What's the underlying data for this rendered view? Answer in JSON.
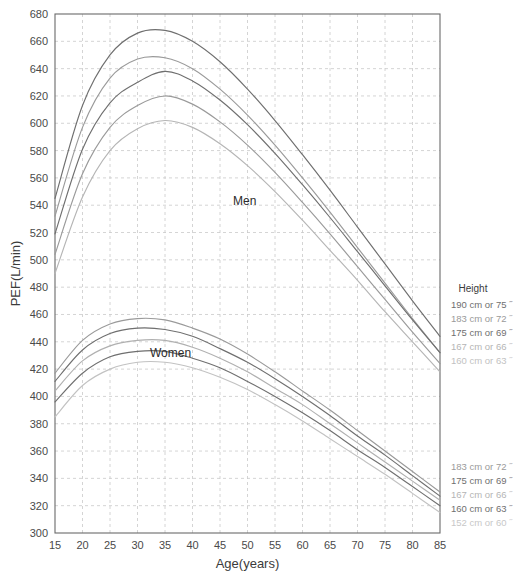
{
  "chart_data": {
    "type": "line",
    "title": "",
    "xlabel": "Age(years)",
    "ylabel": "PEF(L/min)",
    "xlim": [
      15,
      85
    ],
    "ylim": [
      300,
      680
    ],
    "xticks": [
      15,
      20,
      25,
      30,
      35,
      40,
      45,
      50,
      55,
      60,
      65,
      70,
      75,
      80,
      85
    ],
    "yticks": [
      300,
      320,
      340,
      360,
      380,
      400,
      420,
      440,
      460,
      480,
      500,
      520,
      540,
      560,
      580,
      600,
      620,
      640,
      660,
      680
    ],
    "grid": true,
    "legend_position": "right",
    "x": [
      15,
      20,
      25,
      30,
      35,
      40,
      45,
      50,
      55,
      60,
      65,
      70,
      75,
      80,
      85
    ],
    "series": [
      {
        "name": "Men 190 cm or 75\"",
        "group": "Men",
        "color": "#6f6f6f",
        "values": [
          545,
          613,
          650,
          666,
          668,
          660,
          645,
          625,
          602,
          577,
          551,
          524,
          497,
          470,
          444
        ]
      },
      {
        "name": "Men 183 cm or 72\"",
        "group": "Men",
        "color": "#9a9a9a",
        "values": [
          532,
          597,
          633,
          647,
          648,
          640,
          625,
          606,
          584,
          560,
          535,
          509,
          483,
          457,
          432
        ]
      },
      {
        "name": "Men 175 cm or 69\"",
        "group": "Men",
        "color": "#6f6f6f",
        "values": [
          519,
          581,
          615,
          630,
          638,
          631,
          617,
          599,
          578,
          555,
          531,
          506,
          481,
          456,
          432
        ]
      },
      {
        "name": "Men 167 cm or 66\"",
        "group": "Men",
        "color": "#9a9a9a",
        "values": [
          504,
          563,
          597,
          613,
          620,
          614,
          601,
          584,
          564,
          542,
          519,
          495,
          471,
          447,
          424
        ]
      },
      {
        "name": "Men 160 cm or 63\"",
        "group": "Men",
        "color": "#b5b5b5",
        "values": [
          490,
          546,
          580,
          596,
          602,
          597,
          585,
          569,
          550,
          529,
          507,
          485,
          462,
          440,
          418
        ]
      },
      {
        "name": "Women 183 cm or 72\"",
        "group": "Women",
        "color": "#9a9a9a",
        "values": [
          417,
          441,
          453,
          457,
          456,
          450,
          442,
          431,
          418,
          404,
          390,
          375,
          360,
          345,
          330
        ]
      },
      {
        "name": "Women 175 cm or 69\"",
        "group": "Women",
        "color": "#6f6f6f",
        "values": [
          411,
          434,
          446,
          450,
          449,
          444,
          435,
          425,
          413,
          400,
          386,
          371,
          357,
          342,
          327
        ]
      },
      {
        "name": "Women 167 cm or 66\"",
        "group": "Women",
        "color": "#b0b0b0",
        "values": [
          404,
          426,
          437,
          441,
          441,
          436,
          428,
          418,
          406,
          394,
          380,
          366,
          352,
          338,
          324
        ]
      },
      {
        "name": "Women 160 cm or 63\"",
        "group": "Women",
        "color": "#6f6f6f",
        "values": [
          396,
          417,
          429,
          433,
          433,
          428,
          421,
          411,
          400,
          388,
          375,
          361,
          348,
          334,
          320
        ]
      },
      {
        "name": "Women 152 cm or 60\"",
        "group": "Women",
        "color": "#c2c2c2",
        "values": [
          385,
          408,
          420,
          425,
          425,
          421,
          414,
          405,
          394,
          382,
          369,
          356,
          343,
          329,
          315
        ]
      }
    ],
    "annotations": [
      {
        "text": "Men",
        "x": 49.5,
        "y": 540
      },
      {
        "text": "Women",
        "x": 36.0,
        "y": 429
      }
    ],
    "legend_groups": [
      {
        "title": "Height",
        "entries": [
          {
            "label": "190 cm or 75 ˝",
            "color": "#6f6f6f"
          },
          {
            "label": "183 cm or 72 ˝",
            "color": "#9a9a9a"
          },
          {
            "label": "175 cm or 69 ˝",
            "color": "#6f6f6f"
          },
          {
            "label": "167 cm or 66 ˝",
            "color": "#b5b5b5"
          },
          {
            "label": "160 cm or 63 ˝",
            "color": "#c2c2c2"
          }
        ]
      },
      {
        "title": "",
        "entries": [
          {
            "label": "183 cm or 72 ˝",
            "color": "#9a9a9a"
          },
          {
            "label": "175 cm or 69 ˝",
            "color": "#6f6f6f"
          },
          {
            "label": "167 cm or 66 ˝",
            "color": "#b5b5b5"
          },
          {
            "label": "160 cm or 63 ˝",
            "color": "#6f6f6f"
          },
          {
            "label": "152 cm or 60 ˝",
            "color": "#c8c8c8"
          }
        ]
      }
    ],
    "style": {
      "grid_color": "#c9c9c9",
      "axis_color": "#6a6a6a",
      "text_color": "#3b3b3b",
      "background": "#ffffff"
    }
  }
}
